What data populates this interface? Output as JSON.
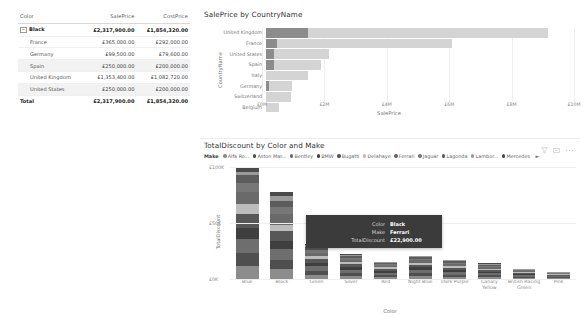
{
  "matrix": {
    "columns": [
      "Color",
      "SalePrice",
      "CostPrice"
    ],
    "group": {
      "expander": "−",
      "label": "Black",
      "sale": "£2,317,900.00",
      "cost": "£1,854,320.00"
    },
    "rows": [
      {
        "label": "France",
        "sale": "£365,000.00",
        "cost": "£292,000.00"
      },
      {
        "label": "Germany",
        "sale": "£99,500.00",
        "cost": "£79,600.00"
      },
      {
        "label": "Spain",
        "sale": "£250,000.00",
        "cost": "£200,000.00"
      },
      {
        "label": "United Kingdom",
        "sale": "£1,353,400.00",
        "cost": "£1,082,720.00"
      },
      {
        "label": "United States",
        "sale": "£250,000.00",
        "cost": "£200,000.00"
      }
    ],
    "total": {
      "label": "Total",
      "sale": "£2,317,900.00",
      "cost": "£1,854,320.00"
    }
  },
  "bar_visual": {
    "title": "SalePrice by CountryName",
    "ylabel": "CountryName",
    "xlabel": "SalePrice"
  },
  "column_visual": {
    "title": "TotalDiscount by Color and Make",
    "ylabel": "TotalDiscount",
    "xlabel": "Color",
    "icons": {
      "filter": "filter-icon",
      "focus": "focus-mode-icon",
      "more": "more-options-icon"
    },
    "legend": {
      "title": "Make",
      "items": [
        {
          "label": "Alfa Ro...",
          "color": "#8c8c8c"
        },
        {
          "label": "Aston Mar...",
          "color": "#4f4f4f"
        },
        {
          "label": "Bentley",
          "color": "#6e6e6e"
        },
        {
          "label": "BMW",
          "color": "#3f3f3f"
        },
        {
          "label": "Bugatti",
          "color": "#575757"
        },
        {
          "label": "Delahaye",
          "color": "#bdbdbd"
        },
        {
          "label": "Ferrari",
          "color": "#6a6a6a"
        },
        {
          "label": "Jaguar",
          "color": "#777777"
        },
        {
          "label": "Lagonda",
          "color": "#5c5c5c"
        },
        {
          "label": "Lambor...",
          "color": "#9a9a9a"
        },
        {
          "label": "Mercedes",
          "color": "#4a4a4a"
        }
      ],
      "more": "►"
    }
  },
  "tooltip": {
    "rows": [
      {
        "key": "Color",
        "value": "Black"
      },
      {
        "key": "Make",
        "value": "Ferrari"
      },
      {
        "key": "TotalDiscount",
        "value": "£22,900.00"
      }
    ]
  },
  "chart_data": [
    {
      "type": "bar",
      "title": "SalePrice by CountryName",
      "xlabel": "SalePrice",
      "ylabel": "CountryName",
      "orientation": "horizontal",
      "categories": [
        "United Kingdom",
        "France",
        "United States",
        "Spain",
        "Italy",
        "Germany",
        "Switzerland",
        "Belgium"
      ],
      "values": [
        9.15,
        6.05,
        2.05,
        1.8,
        1.35,
        0.85,
        0.8,
        0.42
      ],
      "highlight_values": [
        1.35,
        0.365,
        0.25,
        0.25,
        0,
        0.0995,
        0,
        0
      ],
      "value_unit": "£M",
      "xlim": [
        0,
        10
      ],
      "xticks": [
        "£0M",
        "£2M",
        "£4M",
        "£6M",
        "£8M",
        "£10M"
      ],
      "xtick_values": [
        0,
        2,
        4,
        6,
        8,
        10
      ],
      "grid": true,
      "bar_color": "#d4d4d4",
      "highlight_color": "#8c8c8c"
    },
    {
      "type": "bar",
      "subtype": "stacked",
      "title": "TotalDiscount by Color and Make",
      "xlabel": "Color",
      "ylabel": "TotalDiscount",
      "orientation": "vertical",
      "categories": [
        "Blue",
        "Black",
        "Green",
        "Silver",
        "Red",
        "Night Blue",
        "Dark Purple",
        "Canary Yellow",
        "British Racing Green",
        "Pink"
      ],
      "ylim": [
        0,
        100
      ],
      "yticks": [
        "£0K",
        "£50K",
        "£100K"
      ],
      "ytick_values": [
        0,
        50,
        100
      ],
      "value_unit": "£K",
      "totals": [
        99,
        78,
        31,
        21,
        15.5,
        20,
        17,
        13,
        9,
        6
      ],
      "legend_position": "top",
      "series": [
        {
          "name": "Alfa Ro...",
          "color": "#8c8c8c",
          "values": [
            12,
            9,
            4,
            3,
            2,
            3,
            2,
            2,
            1.2,
            0.9
          ]
        },
        {
          "name": "Aston Mar...",
          "color": "#4f4f4f",
          "values": [
            11,
            8,
            3.5,
            2.6,
            1.8,
            2.6,
            2,
            1.6,
            1,
            0.7
          ]
        },
        {
          "name": "Bentley",
          "color": "#6e6e6e",
          "values": [
            13,
            10,
            4,
            2.8,
            2,
            2.8,
            2.2,
            1.7,
            1.2,
            0.8
          ]
        },
        {
          "name": "BMW",
          "color": "#3f3f3f",
          "values": [
            10,
            7,
            3,
            2.2,
            1.6,
            2.1,
            1.8,
            1.4,
            0.9,
            0.6
          ]
        },
        {
          "name": "Bugatti",
          "color": "#575757",
          "values": [
            12,
            8.5,
            3.4,
            2.4,
            1.7,
            2.3,
            1.9,
            1.5,
            1,
            0.7
          ]
        },
        {
          "name": "Delahaye",
          "color": "#bdbdbd",
          "values": [
            9,
            6,
            2.6,
            1.8,
            1.3,
            1.7,
            1.5,
            1.1,
            0.8,
            0.5
          ]
        },
        {
          "name": "Ferrari",
          "color": "#6a6a6a",
          "values": [
            11,
            9.5,
            3.2,
            2.2,
            1.6,
            2.1,
            1.8,
            1.3,
            0.9,
            0.6
          ]
        },
        {
          "name": "Jaguar",
          "color": "#777777",
          "values": [
            8,
            6.5,
            2.5,
            1.7,
            1.2,
            1.6,
            1.4,
            1,
            0.7,
            0.5
          ]
        },
        {
          "name": "Lagonda",
          "color": "#5c5c5c",
          "values": [
            7,
            5.5,
            2.2,
            1.5,
            1.1,
            1.4,
            1.2,
            0.9,
            0.6,
            0.4
          ]
        },
        {
          "name": "Lambor...",
          "color": "#9a9a9a",
          "values": [
            3,
            4,
            1.8,
            0.9,
            0.7,
            0.9,
            0.8,
            0.6,
            0.4,
            0.2
          ]
        },
        {
          "name": "Mercedes",
          "color": "#4a4a4a",
          "values": [
            3,
            4,
            0.8,
            0.9,
            0.5,
            0.5,
            0.4,
            0.9,
            0.3,
            0.1
          ]
        }
      ]
    }
  ]
}
